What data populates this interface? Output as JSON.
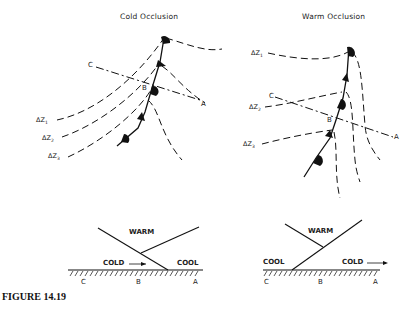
{
  "figure": {
    "caption": "FIGURE 14.19",
    "colors": {
      "line": "#111111",
      "background": "#ffffff"
    }
  },
  "cold_occlusion": {
    "title": "Cold Occlusion",
    "points": {
      "c": "C",
      "b": "B",
      "a": "A"
    },
    "contours": [
      {
        "label": "ΔZ",
        "sub": "1"
      },
      {
        "label": "ΔZ",
        "sub": "2"
      },
      {
        "label": "ΔZ",
        "sub": "3"
      }
    ],
    "cross_section": {
      "warm": "WARM",
      "cold": "COLD",
      "cool": "COOL",
      "c": "C",
      "b": "B",
      "a": "A"
    }
  },
  "warm_occlusion": {
    "title": "Warm Occlusion",
    "points": {
      "c": "C",
      "b": "B",
      "a": "A"
    },
    "contours": [
      {
        "label": "ΔZ",
        "sub": "1"
      },
      {
        "label": "ΔZ",
        "sub": "2"
      },
      {
        "label": "ΔZ",
        "sub": "3"
      }
    ],
    "cross_section": {
      "warm": "WARM",
      "cool": "COOL",
      "cold": "COLD",
      "c": "C",
      "b": "B",
      "a": "A"
    }
  }
}
